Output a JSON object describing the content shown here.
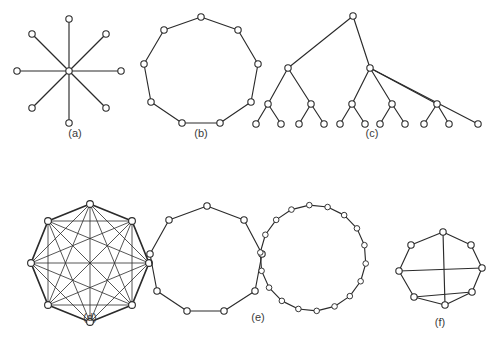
{
  "figure": {
    "background_color": "#ffffff",
    "stroke_color": "#2b2b2b",
    "vertex_fill": "#ffffff",
    "label_color": "#3a3a3a",
    "width": 499,
    "height": 340
  },
  "panels": [
    {
      "id": "a",
      "label": "(a)",
      "name": "star-graph",
      "description": "Star graph with one central hub and eight spokes",
      "vertex_count": 9,
      "edge_count": 8,
      "label_x": 75,
      "label_y": 134,
      "radius": 3.2,
      "center": {
        "x": 69,
        "y": 71
      },
      "outer_vertices": [
        {
          "x": 69,
          "y": 19
        },
        {
          "x": 106,
          "y": 34
        },
        {
          "x": 121,
          "y": 71
        },
        {
          "x": 106,
          "y": 108
        },
        {
          "x": 69,
          "y": 123
        },
        {
          "x": 32,
          "y": 108
        },
        {
          "x": 17,
          "y": 71
        },
        {
          "x": 32,
          "y": 34
        }
      ]
    },
    {
      "id": "b",
      "label": "(b)",
      "name": "cycle-graph-nine",
      "description": "Simple cycle on nine vertices",
      "vertex_count": 9,
      "edge_count": 9,
      "label_x": 201,
      "label_y": 134,
      "radius": 3.2,
      "vertices": [
        {
          "x": 201,
          "y": 17
        },
        {
          "x": 238,
          "y": 30
        },
        {
          "x": 258,
          "y": 64
        },
        {
          "x": 251,
          "y": 102
        },
        {
          "x": 220,
          "y": 123
        },
        {
          "x": 182,
          "y": 123
        },
        {
          "x": 151,
          "y": 102
        },
        {
          "x": 144,
          "y": 64
        },
        {
          "x": 164,
          "y": 30
        }
      ]
    },
    {
      "id": "c",
      "label": "(c)",
      "name": "tree-graph",
      "description": "Rooted tree with branching internal nodes and leaf row",
      "vertex_count": 24,
      "edge_count": 23,
      "label_x": 372,
      "label_y": 134,
      "radius": 3.2,
      "nodes": [
        {
          "id": "root",
          "x": 353,
          "y": 16
        },
        {
          "id": "L",
          "x": 288,
          "y": 68
        },
        {
          "id": "R",
          "x": 370,
          "y": 68
        },
        {
          "id": "L1",
          "x": 268,
          "y": 104
        },
        {
          "id": "L2",
          "x": 311,
          "y": 104
        },
        {
          "id": "R1",
          "x": 352,
          "y": 104
        },
        {
          "id": "R2",
          "x": 392,
          "y": 104
        },
        {
          "id": "R3",
          "x": 437,
          "y": 104
        },
        {
          "id": "leaf1",
          "x": 256,
          "y": 124
        },
        {
          "id": "leaf2",
          "x": 281,
          "y": 124
        },
        {
          "id": "leaf3",
          "x": 299,
          "y": 124
        },
        {
          "id": "leaf4",
          "x": 324,
          "y": 124
        },
        {
          "id": "leaf5",
          "x": 340,
          "y": 124
        },
        {
          "id": "leaf6",
          "x": 365,
          "y": 124
        },
        {
          "id": "leaf7",
          "x": 380,
          "y": 124
        },
        {
          "id": "leaf8",
          "x": 405,
          "y": 124
        },
        {
          "id": "leaf9",
          "x": 424,
          "y": 124
        },
        {
          "id": "leaf10",
          "x": 449,
          "y": 124
        },
        {
          "id": "leaf11",
          "x": 478,
          "y": 124
        }
      ],
      "edges": [
        [
          "root",
          "L"
        ],
        [
          "root",
          "R"
        ],
        [
          "L",
          "L1"
        ],
        [
          "L",
          "L2"
        ],
        [
          "R",
          "R1"
        ],
        [
          "R",
          "R2"
        ],
        [
          "R",
          "R3"
        ],
        [
          "R",
          "leaf11"
        ],
        [
          "L1",
          "leaf1"
        ],
        [
          "L1",
          "leaf2"
        ],
        [
          "L2",
          "leaf3"
        ],
        [
          "L2",
          "leaf4"
        ],
        [
          "R1",
          "leaf5"
        ],
        [
          "R1",
          "leaf6"
        ],
        [
          "R2",
          "leaf7"
        ],
        [
          "R2",
          "leaf8"
        ],
        [
          "R3",
          "leaf9"
        ],
        [
          "R3",
          "leaf10"
        ]
      ]
    },
    {
      "id": "d",
      "label": "(d)",
      "name": "complete-graph-k8",
      "description": "Complete graph K8 with every pair of eight vertices joined",
      "vertex_count": 8,
      "edge_count": 28,
      "label_x": 90,
      "label_y": 318,
      "radius": 3.4,
      "vertices": [
        {
          "x": 90,
          "y": 204
        },
        {
          "x": 132,
          "y": 221
        },
        {
          "x": 149,
          "y": 263
        },
        {
          "x": 132,
          "y": 305
        },
        {
          "x": 90,
          "y": 322
        },
        {
          "x": 48,
          "y": 305
        },
        {
          "x": 31,
          "y": 263
        },
        {
          "x": 48,
          "y": 221
        }
      ]
    },
    {
      "id": "e",
      "label": "(e)",
      "name": "two-touching-cycles",
      "description": "A nine-vertex cycle adjoining an eighteen-vertex cycle",
      "vertex_count": 27,
      "edge_count": 27,
      "label_x": 258,
      "label_y": 318,
      "radius_left": 3.2,
      "radius_right": 2.8,
      "left_cycle": [
        {
          "x": 207,
          "y": 206
        },
        {
          "x": 244,
          "y": 220
        },
        {
          "x": 262,
          "y": 254
        },
        {
          "x": 255,
          "y": 291
        },
        {
          "x": 224,
          "y": 311
        },
        {
          "x": 187,
          "y": 311
        },
        {
          "x": 157,
          "y": 291
        },
        {
          "x": 150,
          "y": 254
        },
        {
          "x": 169,
          "y": 220
        }
      ],
      "right_cycle_center": {
        "x": 313,
        "y": 258
      },
      "right_cycle_rx": 53,
      "right_cycle_ry": 53,
      "right_cycle_count": 18,
      "right_cycle_start_angle": 186
    },
    {
      "id": "f",
      "label": "(f)",
      "name": "cycle-with-chords",
      "description": "Eight-vertex outer cycle with two crossing chords",
      "vertex_count": 8,
      "edge_count": 10,
      "label_x": 440,
      "label_y": 323,
      "radius": 3.2,
      "nodes": [
        {
          "id": "v0",
          "x": 443,
          "y": 232
        },
        {
          "id": "v1",
          "x": 471,
          "y": 245
        },
        {
          "id": "v2",
          "x": 482,
          "y": 268
        },
        {
          "id": "v3",
          "x": 472,
          "y": 292
        },
        {
          "id": "v4",
          "x": 445,
          "y": 305
        },
        {
          "id": "v5",
          "x": 414,
          "y": 297
        },
        {
          "id": "v6",
          "x": 399,
          "y": 271
        },
        {
          "id": "v7",
          "x": 411,
          "y": 245
        }
      ],
      "edges": [
        [
          "v0",
          "v1"
        ],
        [
          "v1",
          "v2"
        ],
        [
          "v2",
          "v3"
        ],
        [
          "v3",
          "v4"
        ],
        [
          "v4",
          "v5"
        ],
        [
          "v5",
          "v6"
        ],
        [
          "v6",
          "v7"
        ],
        [
          "v7",
          "v0"
        ],
        [
          "v0",
          "v4"
        ],
        [
          "v6",
          "v2"
        ],
        [
          "v5",
          "v3"
        ]
      ]
    }
  ]
}
